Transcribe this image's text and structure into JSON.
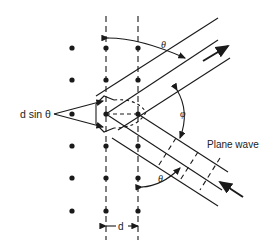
{
  "diagram": {
    "labels": {
      "path_difference": "d sin θ",
      "theta_top": "θ",
      "theta_bottom": "θ",
      "phi": "φ",
      "plane_wave": "Plane wave",
      "spacing": "d"
    },
    "lattice": {
      "columns_x": [
        72,
        106,
        138
      ],
      "rows_y": [
        48,
        80,
        114,
        146,
        178,
        211
      ]
    },
    "colors": {
      "ink": "#1a1a1a",
      "background": "#ffffff"
    }
  }
}
